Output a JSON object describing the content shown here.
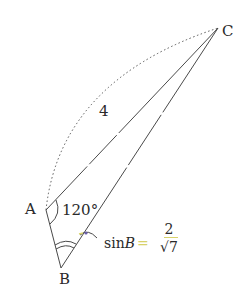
{
  "diagram": {
    "type": "geometry-triangle",
    "points": {
      "A": {
        "label": "A",
        "x": 46,
        "y": 210
      },
      "B": {
        "label": "B",
        "x": 61,
        "y": 268
      },
      "C": {
        "label": "C",
        "x": 218,
        "y": 28
      },
      "D": {
        "x": 86,
        "y": 233
      }
    },
    "labels": {
      "vertex_a": "A",
      "vertex_b": "B",
      "vertex_c": "C",
      "side_ac_length": "4",
      "angle_a": "120°",
      "sin_prefix": "sin",
      "sin_var": "B",
      "equals": "=",
      "frac_num": "2",
      "frac_den": "√7"
    },
    "colors": {
      "line": "#4a4a4a",
      "text": "#2a2a2a",
      "highlight": "#d8d26a",
      "marker": "#6a5fa8"
    }
  }
}
